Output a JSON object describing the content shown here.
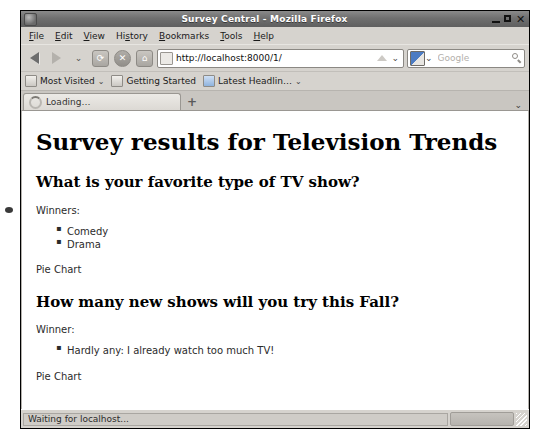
{
  "window": {
    "title": "Survey Central - Mozilla Firefox",
    "app_icon": "firefox-icon",
    "minimize_label": "",
    "maximize_label": "",
    "close_label": "✕"
  },
  "menubar": {
    "items": [
      {
        "label": "File",
        "accel": "F"
      },
      {
        "label": "Edit",
        "accel": "E"
      },
      {
        "label": "View",
        "accel": "V"
      },
      {
        "label": "History",
        "accel": "s"
      },
      {
        "label": "Bookmarks",
        "accel": "B"
      },
      {
        "label": "Tools",
        "accel": "T"
      },
      {
        "label": "Help",
        "accel": "H"
      }
    ]
  },
  "navbar": {
    "back_icon": "back-arrow-icon",
    "forward_icon": "forward-arrow-icon",
    "history_dropdown_icon": "chevron-down-icon",
    "reload_icon": "reload-icon",
    "stop_icon": "stop-icon",
    "home_icon": "home-icon",
    "reload_glyph": "⟳",
    "stop_glyph": "✕",
    "home_glyph": "⌂",
    "url_value": "http://localhost:8000/1/",
    "url_placeholder": "Search or enter address",
    "url_dropdown_icon": "chevron-down-icon",
    "url_dropdown_glyph": "⌄",
    "search_placeholder": "Google",
    "search_value": "",
    "search_engine_icon": "google-engine-icon",
    "search_dropdown_glyph": "⌄",
    "search_magnifier_icon": "search-icon"
  },
  "bookmarks": {
    "items": [
      {
        "label": "Most Visited",
        "icon": "folder-icon",
        "has_chevron": true
      },
      {
        "label": "Getting Started",
        "icon": "firefox-icon",
        "has_chevron": false
      },
      {
        "label": "Latest Headlin…",
        "icon": "feed-icon",
        "has_chevron": true
      }
    ],
    "chevron_glyph": "⌄"
  },
  "tabstrip": {
    "tabs": [
      {
        "label": "Loading…",
        "icon": "loading-spinner-icon",
        "active": true
      }
    ],
    "new_tab_glyph": "+",
    "tab_list_chevron": "⌄"
  },
  "page": {
    "heading": "Survey results for Television Trends",
    "sections": [
      {
        "question": "What is your favorite type of TV show?",
        "winners_label": "Winners:",
        "winners": [
          "Comedy",
          "Drama"
        ],
        "chart_link": "Pie Chart"
      },
      {
        "question": "How many new shows will you try this Fall?",
        "winners_label": "Winner:",
        "winners": [
          "Hardly any: I already watch too much TV!"
        ],
        "chart_link": "Pie Chart"
      }
    ]
  },
  "statusbar": {
    "text": "Waiting for localhost...",
    "progress_visible": true,
    "resize_grip_icon": "resize-grip-icon"
  },
  "colors": {
    "chrome_bg": "#d6d3ce",
    "titlebar_bg": "#6f6f6f",
    "page_bg": "#ffffff",
    "text": "#2b2b2b"
  }
}
